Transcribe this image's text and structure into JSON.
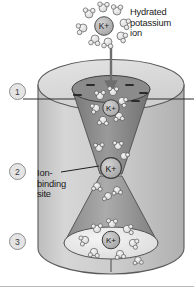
{
  "figure": {
    "title_label": "Hydrated potassium ion",
    "ion_symbol": "K+",
    "steps": [
      {
        "id": "1",
        "label": "1"
      },
      {
        "id": "2",
        "label": "2"
      },
      {
        "id": "3",
        "label": "3"
      }
    ],
    "annotations": {
      "hydrated_ion": "Hydrated\npotassium\nion",
      "binding_site": "Ion-\nbinding\nsite"
    },
    "charges": {
      "symbol": "—",
      "count": 5,
      "meaning": "negative charges lining the channel mouth"
    },
    "ions": {
      "top_external": "K+",
      "upper_channel": "K+",
      "binding_site": "K+",
      "lower_exit": "K+"
    },
    "colors": {
      "background": "#ffffff",
      "cylinder_body": "#c9c9c9",
      "cylinder_top": "#dcdcdc",
      "funnel_dark": "#8e8e8e",
      "funnel_mid": "#a8a8a8",
      "cavity_light": "#ededed",
      "ion_fill": "#b5b5b5",
      "water_fill": "#e8e8e8",
      "outline": "#4a4a4a",
      "text": "#1a1a1a",
      "arrow": "#6a6a6a"
    },
    "icons": {
      "flow_arrow": "down-arrow-icon",
      "leader_line": "leader-line-icon"
    }
  }
}
